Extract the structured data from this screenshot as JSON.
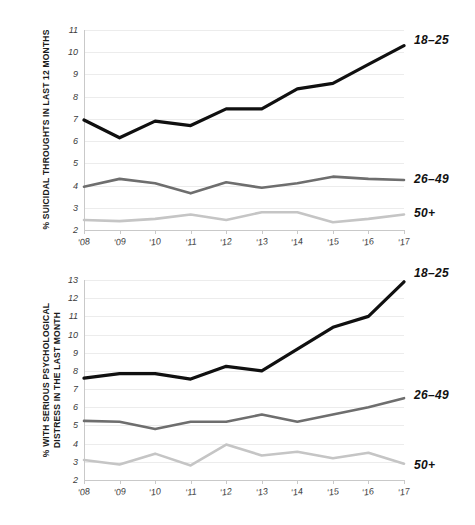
{
  "colors": {
    "series_18_25": "#101010",
    "series_26_49": "#6e6e6e",
    "series_50_plus": "#c5c5c5",
    "gridline": "#ececec",
    "axis": "#c9c9c9",
    "text": "#2b2b2b",
    "background": "#ffffff"
  },
  "legend": {
    "young_label": "18–25",
    "middle_label": "26–49",
    "older_label": "50+"
  },
  "chart_data": [
    {
      "id": "suicidal-thoughts",
      "type": "line",
      "title": "",
      "ylabel": "% SUICIDAL THROUGHTS IN LAST 12 MONTHS",
      "xlabel": "",
      "ylim": [
        2,
        11
      ],
      "yticks": [
        2,
        3,
        4,
        5,
        6,
        7,
        8,
        9,
        10,
        11
      ],
      "ytick_labels": [
        "2",
        "3",
        "4",
        "5",
        "6",
        "7",
        "8",
        "9",
        "10",
        "11"
      ],
      "categories": [
        "'08",
        "'09",
        "'10",
        "'11",
        "'12",
        "'13",
        "'14",
        "'15",
        "'16",
        "'17"
      ],
      "x": [
        2008,
        2009,
        2010,
        2011,
        2012,
        2013,
        2014,
        2015,
        2016,
        2017
      ],
      "grid": true,
      "legend_position": "right-inline",
      "series": [
        {
          "name": "18–25",
          "color": "#101010",
          "width": 3.2,
          "values": [
            6.95,
            6.15,
            6.9,
            6.7,
            7.45,
            7.45,
            8.35,
            8.6,
            9.45,
            10.3
          ]
        },
        {
          "name": "26–49",
          "color": "#6e6e6e",
          "width": 2.6,
          "values": [
            3.95,
            4.3,
            4.1,
            3.65,
            4.15,
            3.9,
            4.1,
            4.4,
            4.3,
            4.25
          ]
        },
        {
          "name": "50+",
          "color": "#c5c5c5",
          "width": 2.6,
          "values": [
            2.45,
            2.4,
            2.5,
            2.7,
            2.45,
            2.8,
            2.8,
            2.35,
            2.5,
            2.7
          ]
        }
      ]
    },
    {
      "id": "psychological-distress",
      "type": "line",
      "title": "",
      "ylabel_line1": "% WITH SERIOUS PSYCHOLOGICAL",
      "ylabel_line2": "DISTRESS IN THE LAST MONTH",
      "ylabel": "% WITH SERIOUS PSYCHOLOGICAL DISTRESS IN THE LAST MONTH",
      "xlabel": "",
      "ylim": [
        2,
        13
      ],
      "yticks": [
        2,
        3,
        4,
        5,
        6,
        7,
        8,
        9,
        10,
        11,
        12,
        13
      ],
      "ytick_labels": [
        "2",
        "3",
        "4",
        "5",
        "6",
        "7",
        "8",
        "9",
        "10",
        "11",
        "12",
        "13"
      ],
      "categories": [
        "'08",
        "'09",
        "'10",
        "'11",
        "'12",
        "'13",
        "'14",
        "'15",
        "'16",
        "'17"
      ],
      "x": [
        2008,
        2009,
        2010,
        2011,
        2012,
        2013,
        2014,
        2015,
        2016,
        2017
      ],
      "grid": true,
      "legend_position": "right-inline",
      "series": [
        {
          "name": "18–25",
          "color": "#101010",
          "width": 3.2,
          "values": [
            7.6,
            7.85,
            7.85,
            7.55,
            8.25,
            8.0,
            9.2,
            10.4,
            11.0,
            12.9
          ]
        },
        {
          "name": "26–49",
          "color": "#6e6e6e",
          "width": 2.6,
          "values": [
            5.25,
            5.2,
            4.8,
            5.2,
            5.2,
            5.6,
            5.2,
            5.6,
            6.0,
            6.5
          ]
        },
        {
          "name": "50+",
          "color": "#c5c5c5",
          "width": 2.6,
          "values": [
            3.1,
            2.85,
            3.45,
            2.8,
            3.95,
            3.35,
            3.55,
            3.2,
            3.5,
            2.9
          ]
        }
      ]
    }
  ]
}
